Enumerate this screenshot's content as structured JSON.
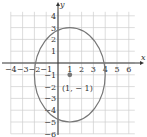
{
  "figure": {
    "x_axis_label": "x",
    "y_axis_label": "y",
    "x_ticks": [
      "-4",
      "-3",
      "-2",
      "-1",
      "1",
      "2",
      "3",
      "4",
      "5",
      "6"
    ],
    "y_ticks": [
      "4",
      "3",
      "2",
      "1",
      "-1",
      "-2",
      "-3",
      "-4",
      "-5",
      "-6"
    ],
    "center_point_label": "(1, − 1)",
    "colors": {
      "curve": "#777777",
      "grid": "#cfcfcf",
      "axis": "#333333",
      "point": "#777777"
    }
  },
  "chart_data": {
    "type": "scatter",
    "title": "",
    "xlabel": "x",
    "ylabel": "y",
    "xlim": [
      -4,
      6
    ],
    "ylim": [
      -6,
      4
    ],
    "grid": true,
    "curve": {
      "shape": "ellipse",
      "center": [
        1,
        -1
      ],
      "semi_axis_x": 3,
      "semi_axis_y": 4,
      "x_intercepts": [
        -2,
        4
      ],
      "y_extent": [
        -5,
        3
      ]
    },
    "points": [
      {
        "x": 1,
        "y": -1,
        "label": "(1, − 1)"
      }
    ]
  }
}
